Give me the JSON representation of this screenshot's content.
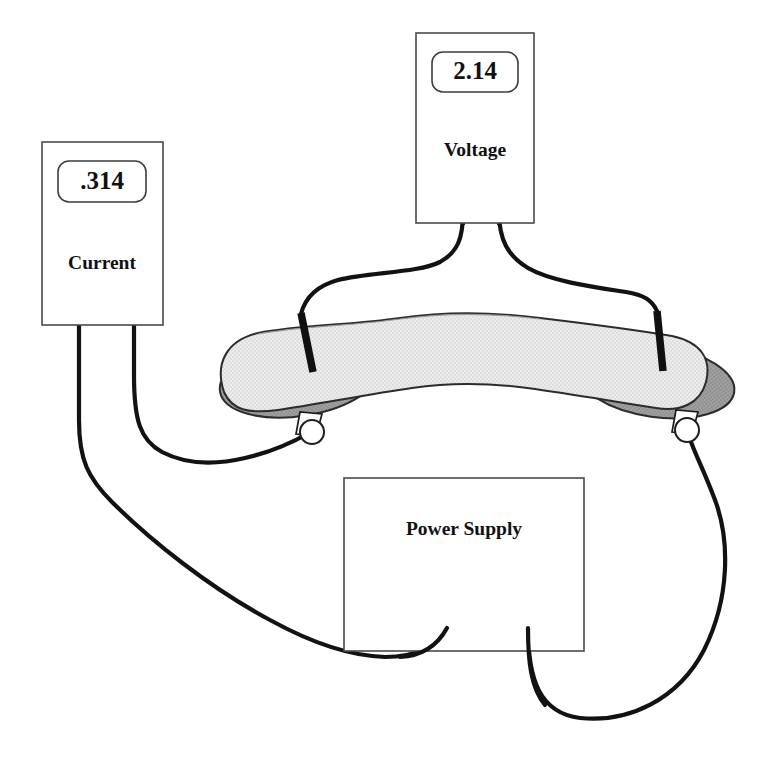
{
  "figure": {
    "kind": "circuit-apparatus-diagram",
    "background_color": "#ffffff",
    "line_color": "#121212"
  },
  "instruments": {
    "voltmeter": {
      "name": "voltmeter",
      "label": "Voltage",
      "reading": "2.14",
      "box": {
        "x": 416,
        "y": 33,
        "width": 118,
        "height": 190
      },
      "readout": {
        "x": 432,
        "y": 52,
        "width": 86,
        "height": 40,
        "radius": 9
      },
      "label_center": {
        "x": 475,
        "y": 152
      },
      "terminals": [
        {
          "name": "voltmeter-terminal-left",
          "x": 463,
          "y": 200
        },
        {
          "name": "voltmeter-terminal-right",
          "x": 498,
          "y": 200
        }
      ]
    },
    "ammeter": {
      "name": "ammeter",
      "label": "Current",
      "reading": ".314",
      "box": {
        "x": 42,
        "y": 142,
        "width": 121,
        "height": 183
      },
      "readout": {
        "x": 58,
        "y": 161,
        "width": 88,
        "height": 41,
        "radius": 9
      },
      "label_center": {
        "x": 102,
        "y": 265
      },
      "terminals": [
        {
          "name": "ammeter-terminal-left",
          "x": 78,
          "y": 283
        },
        {
          "name": "ammeter-terminal-right",
          "x": 133,
          "y": 283
        }
      ]
    },
    "power_supply": {
      "name": "power-supply",
      "label": "Power Supply",
      "box": {
        "x": 344,
        "y": 478,
        "width": 240,
        "height": 173
      },
      "label_center": {
        "x": 464,
        "y": 531
      },
      "terminals": [
        {
          "name": "power-supply-terminal-left",
          "x": 447,
          "y": 628
        },
        {
          "name": "power-supply-terminal-right",
          "x": 527,
          "y": 628
        }
      ]
    }
  },
  "specimen": {
    "name": "curved-bar-specimen",
    "description": "arched light gray bar resting on two dark gray contact pads",
    "fill_color": "#e6e6e6",
    "outline_color": "#2c2c2c"
  },
  "contact_pads": {
    "name": "electrode-contact-pads",
    "fill_color": "#9b9b9b",
    "outline_color": "#2c2c2c",
    "left": {
      "cx": 300,
      "cy": 379,
      "rx": 80,
      "ry": 36,
      "rotation": -9
    },
    "right": {
      "cx": 655,
      "cy": 381,
      "rx": 78,
      "ry": 35,
      "rotation": 8
    }
  },
  "binding_posts": [
    {
      "name": "binding-post-left",
      "x": 311,
      "y": 432
    },
    {
      "name": "binding-post-right",
      "x": 686,
      "y": 430
    }
  ],
  "voltage_probes": [
    {
      "name": "voltage-probe-left",
      "x1": 301,
      "y1": 313,
      "x2": 312,
      "y2": 370
    },
    {
      "name": "voltage-probe-right",
      "x1": 656,
      "y1": 310,
      "x2": 662,
      "y2": 370
    }
  ],
  "wires": [
    {
      "name": "wire-voltmeter-left-to-probe",
      "from": "voltmeter-terminal-left",
      "to": "voltage-probe-left"
    },
    {
      "name": "wire-voltmeter-right-to-probe",
      "from": "voltmeter-terminal-right",
      "to": "voltage-probe-right"
    },
    {
      "name": "wire-ammeter-right-to-left-post",
      "from": "ammeter-terminal-right",
      "to": "binding-post-left"
    },
    {
      "name": "wire-ammeter-left-to-power-supply",
      "from": "ammeter-terminal-left",
      "to": "power-supply-terminal-left"
    },
    {
      "name": "wire-power-supply-to-right-post",
      "from": "power-supply-terminal-right",
      "to": "binding-post-right"
    }
  ]
}
